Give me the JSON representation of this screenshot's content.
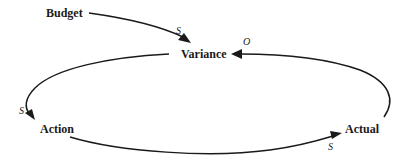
{
  "diagram": {
    "type": "causal-loop",
    "nodes": [
      {
        "id": "budget",
        "label": "Budget"
      },
      {
        "id": "variance",
        "label": "Variance"
      },
      {
        "id": "action",
        "label": "Action"
      },
      {
        "id": "actual",
        "label": "Actual"
      }
    ],
    "edges": [
      {
        "from": "budget",
        "to": "variance",
        "polarity": "S"
      },
      {
        "from": "variance",
        "to": "action",
        "polarity": "S"
      },
      {
        "from": "action",
        "to": "actual",
        "polarity": "S"
      },
      {
        "from": "actual",
        "to": "variance",
        "polarity": "O"
      }
    ]
  }
}
